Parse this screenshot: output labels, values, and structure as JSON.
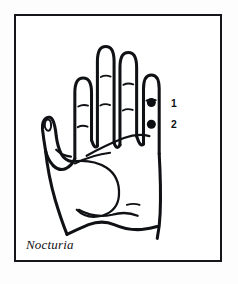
{
  "figure": {
    "caption": "Nocturia",
    "frame_color": "#15161a",
    "background_color": "#ffffff",
    "ink_color": "#101114"
  },
  "points": [
    {
      "id": "1",
      "label": "1",
      "marker": "filled-dot",
      "location": "pinky-finger-upper-phalanx"
    },
    {
      "id": "2",
      "label": "2",
      "marker": "filled-dot",
      "location": "pinky-finger-lower-phalanx"
    }
  ],
  "anatomy": {
    "view": "palmar",
    "digits": [
      "index",
      "middle",
      "ring",
      "little"
    ],
    "thumb": "thumb"
  }
}
